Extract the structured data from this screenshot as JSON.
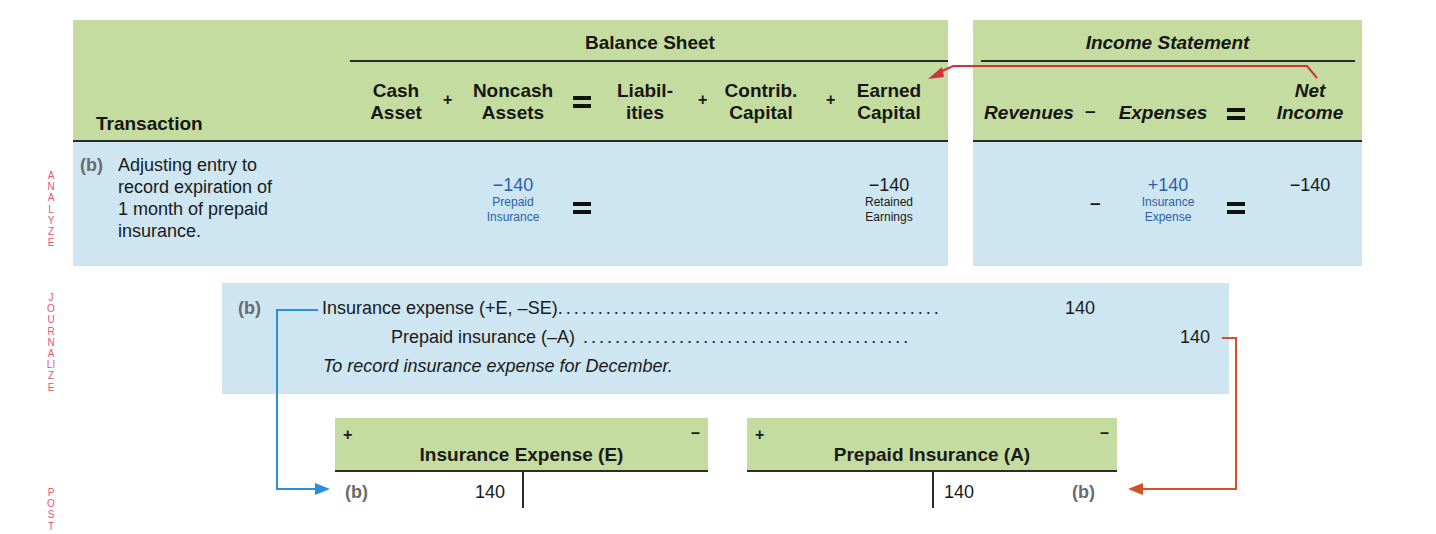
{
  "side_labels": {
    "analyze": "ANALYZE",
    "journalize": "JOURNALIZE",
    "post": "POST"
  },
  "colors": {
    "header_green": "#c5dca0",
    "body_blue": "#cde6f2",
    "side_label_pink": "#e0557a",
    "account_blue": "#2e5fa8",
    "arrow_red": "#d0333a",
    "arrow_blue": "#2a8fd8",
    "arrow_orange": "#d5512a"
  },
  "analyze": {
    "transaction_header": "Transaction",
    "balance_sheet": {
      "title": "Balance Sheet",
      "columns": [
        {
          "line1": "Cash",
          "line2": "Asset"
        },
        {
          "line1": "Noncash",
          "line2": "Assets"
        },
        {
          "line1": "Liabil-",
          "line2": "ities"
        },
        {
          "line1": "Contrib.",
          "line2": "Capital"
        },
        {
          "line1": "Earned",
          "line2": "Capital"
        }
      ],
      "operators": [
        "+",
        "=",
        "+",
        "+"
      ]
    },
    "income_statement": {
      "title": "Income Statement",
      "columns": [
        {
          "line1": "Revenues",
          "line2": ""
        },
        {
          "line1": "Expenses",
          "line2": ""
        },
        {
          "line1": "Net",
          "line2": "Income"
        }
      ],
      "operators": [
        "–",
        "="
      ]
    },
    "row": {
      "ref": "(b)",
      "description_lines": [
        "Adjusting entry to",
        "record expiration of",
        "1 month of prepaid",
        "insurance."
      ],
      "noncash_assets": {
        "amount": "−140",
        "account_line1": "Prepaid",
        "account_line2": "Insurance"
      },
      "earned_capital": {
        "amount": "−140",
        "account_line1": "Retained",
        "account_line2": "Earnings"
      },
      "revenues_operator": "–",
      "expenses": {
        "amount": "+140",
        "account_line1": "Insurance",
        "account_line2": "Expense"
      },
      "net_income": {
        "amount": "−140"
      }
    }
  },
  "journalize": {
    "ref": "(b)",
    "debit_line": "Insurance expense (+E, –SE)",
    "debit_amount": "140",
    "credit_line": "Prepaid insurance (–A)",
    "credit_amount": "140",
    "memo": "To record insurance expense for December."
  },
  "post": {
    "accounts": [
      {
        "title": "Insurance Expense (E)",
        "plus": "+",
        "minus": "–",
        "ref": "(b)",
        "debit": "140",
        "credit": ""
      },
      {
        "title": "Prepaid Insurance (A)",
        "plus": "+",
        "minus": "–",
        "ref": "(b)",
        "debit": "",
        "credit": "140"
      }
    ]
  }
}
